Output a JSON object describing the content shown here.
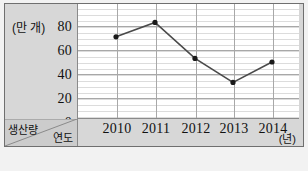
{
  "chart_data": {
    "type": "line",
    "title": "",
    "subtitle": "",
    "xlabel": "연도",
    "ylabel": "생산량",
    "x_unit": "(년)",
    "y_unit": "(만 개)",
    "categories": [
      "2010",
      "2011",
      "2012",
      "2013",
      "2014"
    ],
    "values": [
      71,
      83,
      53,
      33,
      50
    ],
    "series": [
      {
        "name": "생산량",
        "values": [
          71,
          83,
          53,
          33,
          50
        ]
      }
    ],
    "ylim": [
      0,
      90
    ],
    "y_ticks": [
      0,
      20,
      40,
      60,
      80
    ],
    "y_tick_labels": [
      "0",
      "20",
      "40",
      "60",
      "80"
    ],
    "grid": true,
    "minor_grid": true,
    "legend": "none",
    "marker": "filled-circle",
    "line_color": "#4a4a4a",
    "marker_color": "#1a1a1a",
    "grid_color": "#a8a8a8",
    "minor_grid_color": "#dcdcdc",
    "panel_color": "#d7d7d7",
    "plot_background": "#ffffff",
    "frame_color": "#6f6f6f"
  },
  "axes": {
    "y_unit_label": "(만 개)",
    "x_unit_label": "(년)",
    "corner": {
      "top_label": "생산량",
      "bottom_label": "연도"
    }
  }
}
